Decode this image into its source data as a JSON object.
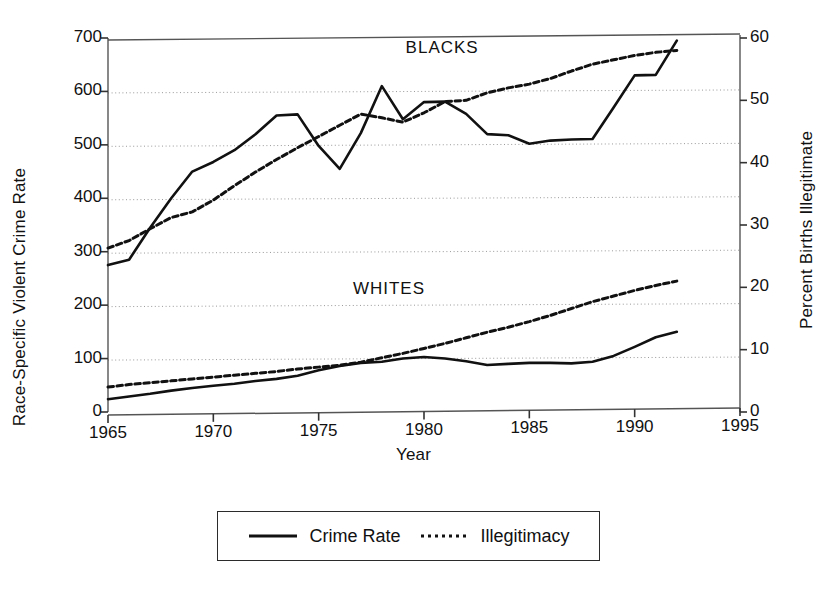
{
  "chart_data": {
    "type": "line",
    "title": "",
    "xlabel": "Year",
    "ylabel_left": "Race-Specific Violent Crime Rate",
    "ylabel_right": "Percent Births Illegitimate",
    "xlim": [
      1965,
      1995
    ],
    "ylim_left": [
      0,
      700
    ],
    "ylim_right": [
      0,
      60
    ],
    "xticks": [
      1965,
      1970,
      1975,
      1980,
      1985,
      1990,
      1995
    ],
    "xtick_labels": [
      "1965",
      "1970",
      "1975",
      "1980",
      "1985",
      "1990",
      "1995"
    ],
    "yticks_left": [
      0,
      100,
      200,
      300,
      400,
      500,
      600,
      700
    ],
    "ytick_labels_left": [
      "0",
      "100",
      "200",
      "300",
      "400",
      "500",
      "600",
      "700"
    ],
    "yticks_right": [
      0,
      10,
      20,
      30,
      40,
      50,
      60
    ],
    "ytick_labels_right": [
      "0",
      "10",
      "20",
      "30",
      "40",
      "50",
      "60"
    ],
    "grid": true,
    "grid_style": "dotted-horizontal",
    "legend_position": "below-plot",
    "annotations": [
      {
        "text": "BLACKS",
        "x": 1981.5,
        "y_left": 680
      },
      {
        "text": "WHITES",
        "x": 1979.0,
        "y_left": 228
      }
    ],
    "series": [
      {
        "name": "Crime Rate",
        "group": "BLACKS",
        "axis": "left",
        "style": "solid",
        "color": "#111111",
        "x": [
          1965,
          1966,
          1967,
          1968,
          1969,
          1970,
          1971,
          1972,
          1973,
          1974,
          1975,
          1976,
          1977,
          1978,
          1979,
          1980,
          1981,
          1982,
          1983,
          1984,
          1985,
          1986,
          1987,
          1988,
          1989,
          1990,
          1991,
          1992
        ],
        "values": [
          275,
          285,
          345,
          400,
          450,
          468,
          490,
          520,
          555,
          557,
          498,
          455,
          522,
          610,
          548,
          580,
          581,
          558,
          520,
          518,
          502,
          508,
          510,
          511,
          570,
          630,
          631,
          695
        ]
      },
      {
        "name": "Illegitimacy",
        "group": "BLACKS",
        "axis": "right",
        "style": "dotted",
        "color": "#111111",
        "x": [
          1965,
          1966,
          1967,
          1968,
          1969,
          1970,
          1971,
          1972,
          1973,
          1974,
          1975,
          1976,
          1977,
          1978,
          1979,
          1980,
          1981,
          1982,
          1983,
          1984,
          1985,
          1986,
          1987,
          1988,
          1989,
          1990,
          1991,
          1992
        ],
        "values": [
          26.3,
          27.5,
          29.4,
          31.2,
          32.1,
          34.0,
          36.3,
          38.5,
          40.5,
          42.4,
          44.2,
          46.0,
          47.8,
          47.2,
          46.5,
          48.0,
          49.8,
          50.0,
          51.2,
          52.0,
          52.6,
          53.5,
          54.7,
          55.8,
          56.5,
          57.2,
          57.7,
          58.0
        ]
      },
      {
        "name": "Crime Rate",
        "group": "WHITES",
        "axis": "left",
        "style": "solid",
        "color": "#111111",
        "x": [
          1965,
          1966,
          1967,
          1968,
          1969,
          1970,
          1971,
          1972,
          1973,
          1974,
          1975,
          1976,
          1977,
          1978,
          1979,
          1980,
          1981,
          1982,
          1983,
          1984,
          1985,
          1986,
          1987,
          1988,
          1989,
          1990,
          1991,
          1992
        ],
        "values": [
          24,
          29,
          34,
          40,
          45,
          49,
          53,
          58,
          62,
          68,
          78,
          86,
          92,
          94,
          100,
          103,
          100,
          95,
          88,
          90,
          92,
          92,
          91,
          94,
          105,
          122,
          140,
          150
        ]
      },
      {
        "name": "Illegitimacy",
        "group": "WHITES",
        "axis": "right",
        "style": "dotted",
        "color": "#111111",
        "x": [
          1965,
          1966,
          1967,
          1968,
          1969,
          1970,
          1971,
          1972,
          1973,
          1974,
          1975,
          1976,
          1977,
          1978,
          1979,
          1980,
          1981,
          1982,
          1983,
          1984,
          1985,
          1986,
          1987,
          1988,
          1989,
          1990,
          1991,
          1992
        ],
        "values": [
          4.0,
          4.4,
          4.7,
          5.0,
          5.3,
          5.6,
          5.9,
          6.2,
          6.5,
          6.9,
          7.2,
          7.5,
          8.0,
          8.7,
          9.4,
          10.2,
          11.0,
          11.9,
          12.8,
          13.6,
          14.5,
          15.5,
          16.6,
          17.7,
          18.6,
          19.5,
          20.3,
          21.0
        ]
      }
    ]
  },
  "legend": {
    "entries": [
      {
        "label": "Crime Rate",
        "style": "solid"
      },
      {
        "label": "Illegitimacy",
        "style": "dotted"
      }
    ]
  }
}
